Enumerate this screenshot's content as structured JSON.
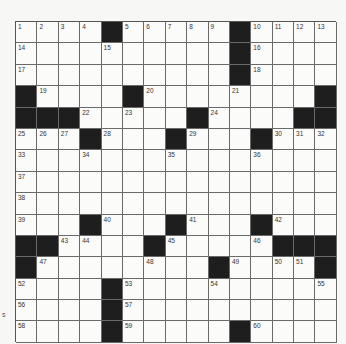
{
  "puzzle": {
    "rows": 15,
    "cols": 15,
    "grid": [
      "....#.....#....",
      ".........#.....",
      "..........#....",
      "#....#.........#",
      "###......#....##",
      "...#...#...#...",
      "...............",
      "...............",
      "...............",
      "...#...#...#...",
      "##.....#.....###",
      "#.........#....#",
      "....#..........",
      "....#..........",
      "....#.....#...."
    ],
    "black_cells": [
      [
        0,
        4
      ],
      [
        0,
        10
      ],
      [
        1,
        10
      ],
      [
        2,
        10
      ],
      [
        3,
        0
      ],
      [
        3,
        5
      ],
      [
        3,
        14
      ],
      [
        4,
        0
      ],
      [
        4,
        1
      ],
      [
        4,
        2
      ],
      [
        4,
        8
      ],
      [
        4,
        13
      ],
      [
        4,
        14
      ],
      [
        5,
        3
      ],
      [
        5,
        7
      ],
      [
        5,
        11
      ],
      [
        9,
        3
      ],
      [
        9,
        7
      ],
      [
        9,
        11
      ],
      [
        10,
        0
      ],
      [
        10,
        1
      ],
      [
        10,
        6
      ],
      [
        10,
        12
      ],
      [
        10,
        13
      ],
      [
        10,
        14
      ],
      [
        11,
        0
      ],
      [
        11,
        9
      ],
      [
        11,
        14
      ],
      [
        12,
        4
      ],
      [
        13,
        4
      ],
      [
        14,
        4
      ],
      [
        14,
        10
      ]
    ],
    "numbers": [
      {
        "r": 0,
        "c": 0,
        "n": "1"
      },
      {
        "r": 0,
        "c": 1,
        "n": "2"
      },
      {
        "r": 0,
        "c": 2,
        "n": "3"
      },
      {
        "r": 0,
        "c": 3,
        "n": "4"
      },
      {
        "r": 0,
        "c": 5,
        "n": "5"
      },
      {
        "r": 0,
        "c": 6,
        "n": "6"
      },
      {
        "r": 0,
        "c": 7,
        "n": "7"
      },
      {
        "r": 0,
        "c": 8,
        "n": "8"
      },
      {
        "r": 0,
        "c": 9,
        "n": "9"
      },
      {
        "r": 0,
        "c": 11,
        "n": "10"
      },
      {
        "r": 0,
        "c": 12,
        "n": "11"
      },
      {
        "r": 0,
        "c": 13,
        "n": "12"
      },
      {
        "r": 0,
        "c": 14,
        "n": "13"
      },
      {
        "r": 1,
        "c": 0,
        "n": "14"
      },
      {
        "r": 1,
        "c": 4,
        "n": "15"
      },
      {
        "r": 1,
        "c": 11,
        "n": "16"
      },
      {
        "r": 2,
        "c": 0,
        "n": "17"
      },
      {
        "r": 2,
        "c": 11,
        "n": "18"
      },
      {
        "r": 3,
        "c": 1,
        "n": "19"
      },
      {
        "r": 3,
        "c": 6,
        "n": "20"
      },
      {
        "r": 3,
        "c": 10,
        "n": "21"
      },
      {
        "r": 4,
        "c": 3,
        "n": "22"
      },
      {
        "r": 4,
        "c": 5,
        "n": "23"
      },
      {
        "r": 4,
        "c": 9,
        "n": "24"
      },
      {
        "r": 5,
        "c": 0,
        "n": "25"
      },
      {
        "r": 5,
        "c": 1,
        "n": "26"
      },
      {
        "r": 5,
        "c": 2,
        "n": "27"
      },
      {
        "r": 5,
        "c": 4,
        "n": "28"
      },
      {
        "r": 5,
        "c": 8,
        "n": "29"
      },
      {
        "r": 5,
        "c": 12,
        "n": "30"
      },
      {
        "r": 5,
        "c": 13,
        "n": "31"
      },
      {
        "r": 5,
        "c": 14,
        "n": "32"
      },
      {
        "r": 6,
        "c": 0,
        "n": "33"
      },
      {
        "r": 6,
        "c": 3,
        "n": "34"
      },
      {
        "r": 6,
        "c": 7,
        "n": "35"
      },
      {
        "r": 6,
        "c": 11,
        "n": "36"
      },
      {
        "r": 7,
        "c": 0,
        "n": "37"
      },
      {
        "r": 8,
        "c": 0,
        "n": "38"
      },
      {
        "r": 9,
        "c": 0,
        "n": "39"
      },
      {
        "r": 9,
        "c": 4,
        "n": "40"
      },
      {
        "r": 9,
        "c": 8,
        "n": "41"
      },
      {
        "r": 9,
        "c": 12,
        "n": "42"
      },
      {
        "r": 10,
        "c": 2,
        "n": "43"
      },
      {
        "r": 10,
        "c": 3,
        "n": "44"
      },
      {
        "r": 10,
        "c": 7,
        "n": "45"
      },
      {
        "r": 10,
        "c": 11,
        "n": "46"
      },
      {
        "r": 11,
        "c": 1,
        "n": "47"
      },
      {
        "r": 11,
        "c": 6,
        "n": "48"
      },
      {
        "r": 11,
        "c": 10,
        "n": "49"
      },
      {
        "r": 11,
        "c": 12,
        "n": "50"
      },
      {
        "r": 11,
        "c": 13,
        "n": "51"
      },
      {
        "r": 12,
        "c": 0,
        "n": "52"
      },
      {
        "r": 12,
        "c": 5,
        "n": "53"
      },
      {
        "r": 12,
        "c": 9,
        "n": "54"
      },
      {
        "r": 12,
        "c": 14,
        "n": "55"
      },
      {
        "r": 13,
        "c": 0,
        "n": "56"
      },
      {
        "r": 13,
        "c": 5,
        "n": "57"
      },
      {
        "r": 14,
        "c": 0,
        "n": "58"
      },
      {
        "r": 14,
        "c": 5,
        "n": "59"
      },
      {
        "r": 14,
        "c": 11,
        "n": "60"
      }
    ]
  },
  "margin_mark": "s",
  "colors": {
    "black_square": "#1e1e1e",
    "white_square": "#fbfbf9",
    "grid_line": "#6a6a6a",
    "page": "#f7f7f5"
  }
}
